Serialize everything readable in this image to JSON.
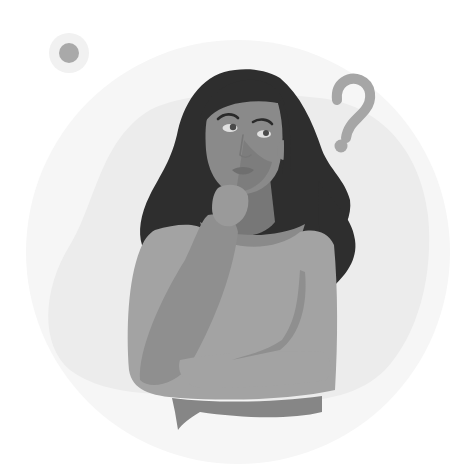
{
  "illustration": {
    "subject": "Thinking woman with hand on chin and a question mark",
    "elements": {
      "question_mark": "?",
      "decorative_dot": "dot",
      "background_blob": "blob",
      "background_circle": "circle"
    }
  },
  "colors": {
    "background": "#ffffff",
    "outer_circle": "#f6f6f6",
    "inner_blob": "#ececec",
    "dot": "#a9a9a9",
    "dot_halo": "#f1f1f1",
    "question_mark": "#a6a6a6",
    "hair": "#2e2e2e",
    "skin": "#8a8a8a",
    "skin_shadow": "#777777",
    "skin_light": "#9a9a9a",
    "sweater": "#a3a3a3",
    "sweater_shadow": "#8f8f8f",
    "sweater_hem": "#868686",
    "eye_white": "#e0e0e0",
    "eye_iris": "#4a4a4a",
    "brow": "#2a2a2a",
    "lips": "#6f6f6f"
  }
}
